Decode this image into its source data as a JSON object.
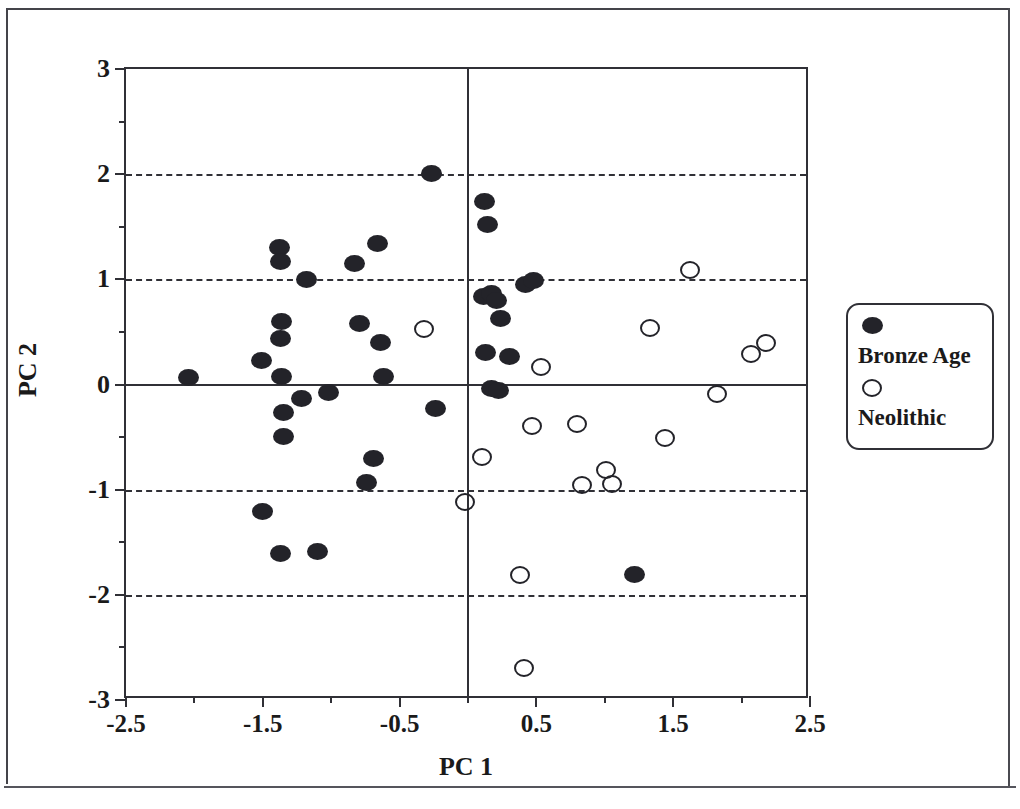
{
  "chart_data": {
    "type": "scatter",
    "title": "",
    "xlabel": "PC 1",
    "ylabel": "PC 2",
    "xlim": [
      -2.5,
      2.5
    ],
    "ylim": [
      -3,
      3
    ],
    "x_ticks": [
      -2.5,
      -1.5,
      -0.5,
      0.5,
      1.5,
      2.5
    ],
    "x_tick_labels": [
      "-2.5",
      "-1.5",
      "-0.5",
      "0.5",
      "1.5",
      "2.5"
    ],
    "x_minor_ticks": [
      -2.0,
      -1.0,
      0.0,
      1.0,
      2.0
    ],
    "y_ticks": [
      -3,
      -2,
      -1,
      0,
      1,
      2,
      3
    ],
    "y_tick_labels": [
      "-3",
      "-2",
      "-1",
      "0",
      "1",
      "2",
      "3"
    ],
    "y_minor_ticks": [
      -2.5,
      -1.5,
      -0.5,
      0.5,
      1.5,
      2.5
    ],
    "gridlines_y": [
      2,
      1,
      -1,
      -2
    ],
    "grid": "dashed horizontal gridlines at 2, 1, -1, -2",
    "zero_lines": {
      "horizontal": 0,
      "vertical": 0
    },
    "legend_position": "right outside",
    "series": [
      {
        "name": "Bronze Age",
        "marker": "filled-circle",
        "color": "#232329",
        "points": [
          [
            -2.04,
            0.07
          ],
          [
            -1.51,
            0.23
          ],
          [
            -1.5,
            -1.21
          ],
          [
            -1.38,
            1.3
          ],
          [
            -1.37,
            1.17
          ],
          [
            -1.36,
            0.6
          ],
          [
            -1.37,
            0.44
          ],
          [
            -1.36,
            0.08
          ],
          [
            -1.35,
            -0.27
          ],
          [
            -1.35,
            -0.49
          ],
          [
            -1.37,
            -1.61
          ],
          [
            -1.22,
            -0.13
          ],
          [
            -1.18,
            1.0
          ],
          [
            -1.1,
            -1.59
          ],
          [
            -1.02,
            -0.08
          ],
          [
            -0.83,
            1.15
          ],
          [
            -0.79,
            0.58
          ],
          [
            -0.74,
            -0.93
          ],
          [
            -0.66,
            1.34
          ],
          [
            -0.69,
            -0.7
          ],
          [
            -0.64,
            0.4
          ],
          [
            -0.62,
            0.08
          ],
          [
            -0.27,
            2.01
          ],
          [
            -0.24,
            -0.23
          ],
          [
            0.12,
            1.74
          ],
          [
            0.14,
            1.52
          ],
          [
            0.11,
            0.84
          ],
          [
            0.17,
            0.87
          ],
          [
            0.21,
            0.8
          ],
          [
            0.24,
            0.63
          ],
          [
            0.13,
            0.3
          ],
          [
            0.17,
            -0.04
          ],
          [
            0.22,
            -0.06
          ],
          [
            0.3,
            0.27
          ],
          [
            0.42,
            0.95
          ],
          [
            0.48,
            0.99
          ],
          [
            1.22,
            -1.81
          ]
        ]
      },
      {
        "name": "Neolithic",
        "marker": "open-circle",
        "color": "#232329",
        "points": [
          [
            -0.32,
            0.53
          ],
          [
            -0.02,
            -1.12
          ],
          [
            0.1,
            -0.69
          ],
          [
            0.38,
            -1.81
          ],
          [
            0.41,
            -2.7
          ],
          [
            0.47,
            -0.39
          ],
          [
            0.53,
            0.17
          ],
          [
            0.8,
            -0.38
          ],
          [
            0.83,
            -0.96
          ],
          [
            1.01,
            -0.81
          ],
          [
            1.05,
            -0.95
          ],
          [
            1.33,
            0.54
          ],
          [
            1.44,
            -0.51
          ],
          [
            1.62,
            1.09
          ],
          [
            1.82,
            -0.09
          ],
          [
            2.07,
            0.29
          ],
          [
            2.18,
            0.39
          ]
        ]
      }
    ]
  },
  "legend": {
    "entries": [
      {
        "label": "Bronze Age",
        "marker": "filled-circle"
      },
      {
        "label": "Neolithic",
        "marker": "open-circle"
      }
    ]
  }
}
